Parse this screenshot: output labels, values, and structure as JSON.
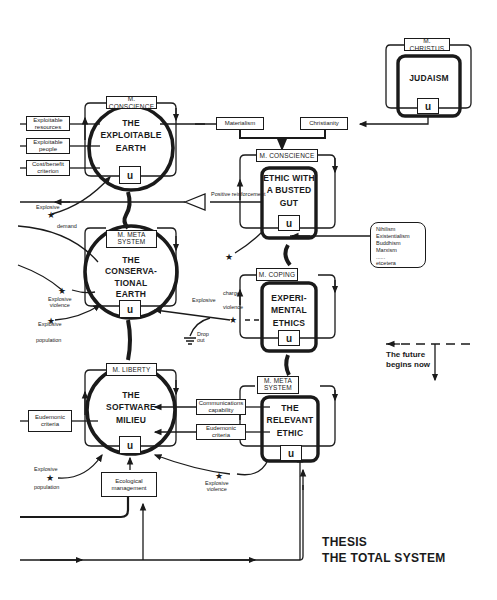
{
  "diagram": {
    "title_line1": "THESIS",
    "title_line2": "THE TOTAL SYSTEM",
    "future_line1": "The future",
    "future_line2": "begins now",
    "ink_color": "#1a1a1a",
    "background_color": "#ffffff"
  },
  "nodes": {
    "exploitable_earth": {
      "title_lines": [
        "THE",
        "EXPLOITABLE",
        "EARTH"
      ],
      "meta": "M. CONSCIENCE",
      "u": "u",
      "inputs": [
        "Exploitable resources",
        "Exploitable people",
        "Cost/benefit criterion"
      ]
    },
    "conservational_earth": {
      "title_lines": [
        "THE",
        "CONSERVA-",
        "TIONAL",
        "EARTH"
      ],
      "meta": "M. META SYSTEM",
      "u": "u"
    },
    "software_milieu": {
      "title_lines": [
        "THE",
        "SOFTWARE",
        "MILIEU"
      ],
      "meta": "M. LIBERTY",
      "u": "u",
      "inputs": [
        "Eudemonic criteria"
      ],
      "bottom_box": "Ecological management"
    },
    "judaism": {
      "title_lines": [
        "JUDAISM"
      ],
      "meta": "M. CHRISTUS",
      "u": "u"
    },
    "ethic_busted_gut": {
      "title_lines": [
        "ETHIC WITH",
        "A BUSTED",
        "GUT"
      ],
      "meta": "M. CONSCIENCE",
      "u": "u",
      "inputs": [
        "Materialism",
        "Christianity"
      ]
    },
    "experimental_ethics": {
      "title_lines": [
        "EXPERI-",
        "MENTAL",
        "ETHICS"
      ],
      "meta": "M. COPING",
      "u": "u",
      "side_list": [
        "Nihilism",
        "Existentialism",
        "Buddhism",
        "Marxism",
        "......",
        "etcetera"
      ]
    },
    "relevant_ethic": {
      "title_lines": [
        "THE",
        "RELEVANT",
        "ETHIC"
      ],
      "meta": "M. META SYSTEM",
      "u": "u",
      "inputs": [
        "Communications capability",
        "Eudemonic criteria"
      ]
    }
  },
  "annotations": {
    "positive_reinforcement": "Positive reinforcement",
    "explosive_demand_1": "Explosive",
    "explosive_demand_2": "demand",
    "explosive_violence_1_1": "Explosive",
    "explosive_violence_1_2": "violence",
    "explosive_population_1_1": "Explosive",
    "explosive_population_1_2": "population",
    "explosive_charge": "Explosive",
    "charge": "charge",
    "violence": "violence",
    "drop_out_1": "Drop",
    "drop_out_2": "out",
    "explosive_population_2_1": "Explosive",
    "explosive_population_2_2": "population",
    "explosive_violence_2_1": "Explosive",
    "explosive_violence_2_2": "violence"
  }
}
